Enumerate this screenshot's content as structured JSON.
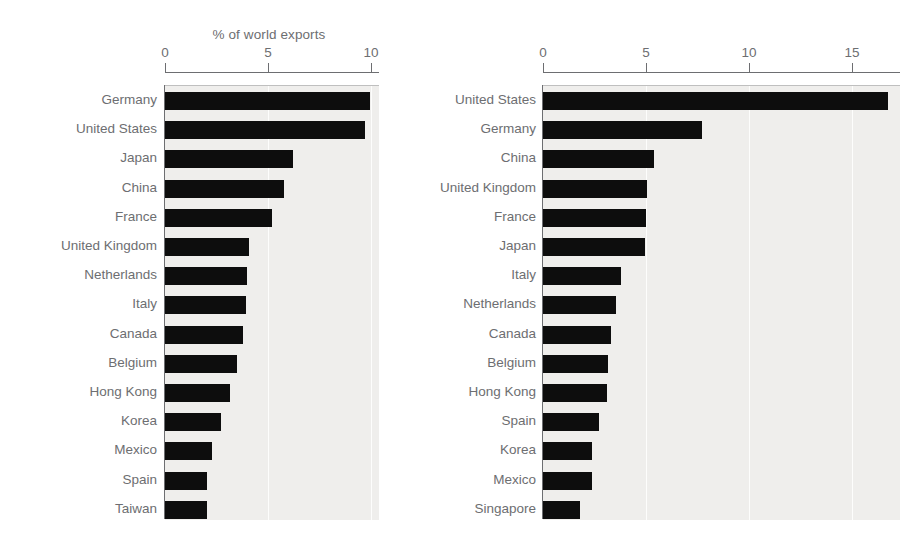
{
  "chart_data": [
    {
      "type": "bar",
      "orientation": "horizontal",
      "id": "world-exports",
      "title": "% of world exports",
      "xlabel": "",
      "ylabel": "",
      "xlim": [
        0,
        10
      ],
      "xticks": [
        0,
        5,
        10
      ],
      "xticklabels": [
        "0",
        "5",
        "10"
      ],
      "grid": "vertical-light",
      "legend": "none",
      "bar_color": "#0d0d0d",
      "plot_background": "#efeeec",
      "categories": [
        "Germany",
        "United States",
        "Japan",
        "China",
        "France",
        "United Kingdom",
        "Netherlands",
        "Italy",
        "Canada",
        "Belgium",
        "Hong Kong",
        "Korea",
        "Mexico",
        "Spain",
        "Taiwan"
      ],
      "values": [
        9.95,
        9.7,
        6.2,
        5.8,
        5.2,
        4.1,
        4.0,
        3.95,
        3.8,
        3.5,
        3.15,
        2.7,
        2.3,
        2.05,
        2.05
      ]
    },
    {
      "type": "bar",
      "orientation": "horizontal",
      "id": "world-imports",
      "title": "% of world imports",
      "xlabel": "",
      "ylabel": "",
      "xlim": [
        0,
        17.5
      ],
      "xticks": [
        0,
        5,
        10,
        15
      ],
      "xticklabels": [
        "0",
        "5",
        "10",
        "15"
      ],
      "grid": "vertical-light",
      "legend": "none",
      "bar_color": "#0d0d0d",
      "plot_background": "#efeeec",
      "categories": [
        "United States",
        "Germany",
        "China",
        "United Kingdom",
        "France",
        "Japan",
        "Italy",
        "Netherlands",
        "Canada",
        "Belgium",
        "Hong Kong",
        "Spain",
        "Korea",
        "Mexico",
        "Singapore"
      ],
      "values": [
        16.75,
        7.7,
        5.4,
        5.05,
        5.0,
        4.95,
        3.8,
        3.55,
        3.3,
        3.15,
        3.1,
        2.7,
        2.4,
        2.4,
        1.8
      ]
    }
  ]
}
